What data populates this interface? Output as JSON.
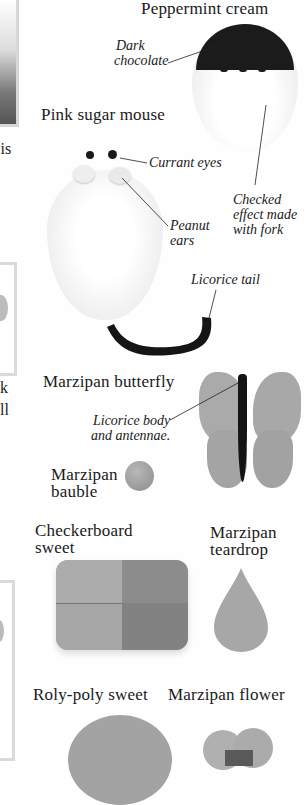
{
  "page": {
    "left_fragments": [
      "t is",
      "k",
      "ll"
    ]
  },
  "items": [
    {
      "id": "peppermint-cream",
      "title": "Peppermint cream",
      "annotations": [
        "Dark\nchocolate",
        "Checked\neffect made\nwith fork"
      ]
    },
    {
      "id": "pink-sugar-mouse",
      "title": "Pink sugar mouse",
      "annotations": [
        "Currant eyes",
        "Peanut\nears",
        "Licorice tail"
      ]
    },
    {
      "id": "marzipan-butterfly",
      "title": "Marzipan butterfly",
      "annotations": [
        "Licorice body\nand antennae."
      ]
    },
    {
      "id": "marzipan-bauble",
      "title": "Marzipan\nbauble",
      "annotations": []
    },
    {
      "id": "checkerboard-sweet",
      "title": "Checkerboard\nsweet",
      "annotations": []
    },
    {
      "id": "marzipan-teardrop",
      "title": "Marzipan\nteardrop",
      "annotations": []
    },
    {
      "id": "roly-poly-sweet",
      "title": "Roly-poly sweet",
      "annotations": []
    },
    {
      "id": "marzipan-flower",
      "title": "Marzipan flower",
      "annotations": []
    }
  ],
  "labels": {
    "peppermint": "Peppermint cream",
    "dark_chocolate_1": "Dark",
    "dark_chocolate_2": "chocolate",
    "checked_1": "Checked",
    "checked_2": "effect made",
    "checked_3": "with fork",
    "mouse": "Pink sugar mouse",
    "currant": "Currant eyes",
    "peanut_1": "Peanut",
    "peanut_2": "ears",
    "tail": "Licorice tail",
    "butterfly": "Marzipan butterfly",
    "licorice_body_1": "Licorice body",
    "licorice_body_2": "and antennae.",
    "bauble_1": "Marzipan",
    "bauble_2": "bauble",
    "checker_1": "Checkerboard",
    "checker_2": "sweet",
    "teardrop_1": "Marzipan",
    "teardrop_2": "teardrop",
    "rolypoly": "Roly-poly sweet",
    "flower": "Marzipan flower",
    "frag_1": "t is",
    "frag_2": "k",
    "frag_3": "ll"
  },
  "colors": {
    "background": "#fefefe",
    "chocolate": "#1c1c1c",
    "cream": "#f4f4f4",
    "marzipan": "#a9a9a9",
    "licorice": "#141414",
    "frame": "#d9d9d9"
  }
}
